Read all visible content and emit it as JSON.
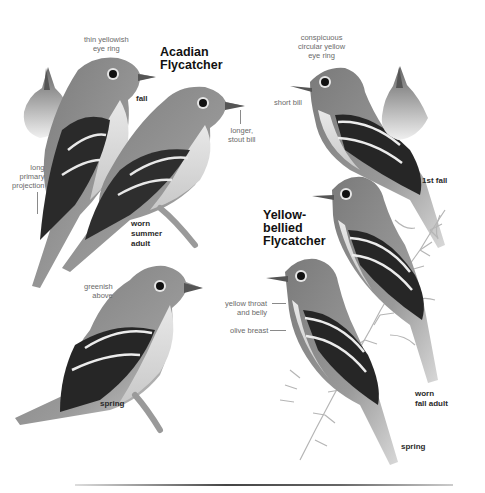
{
  "plate": {
    "type": "field-guide plate",
    "species": [
      {
        "name_lines": [
          "Acadian",
          "Flycatcher"
        ],
        "figures": [
          {
            "age_label": [
              "fall"
            ]
          },
          {
            "age_label": [
              "worn",
              "summer",
              "adult"
            ]
          },
          {
            "age_label": [
              "spring"
            ]
          }
        ],
        "annotations": [
          {
            "text": [
              "thin yellowish",
              "eye ring"
            ]
          },
          {
            "text": [
              "longer,",
              "stout bill"
            ]
          },
          {
            "text": [
              "long",
              "primary",
              "projection"
            ]
          },
          {
            "text": [
              "greenish",
              "above"
            ]
          }
        ]
      },
      {
        "name_lines": [
          "Yellow-",
          "bellied",
          "Flycatcher"
        ],
        "figures": [
          {
            "age_label": [
              "1st fall"
            ]
          },
          {
            "age_label": [
              "worn",
              "fall adult"
            ]
          },
          {
            "age_label": [
              "spring"
            ]
          }
        ],
        "annotations": [
          {
            "text": [
              "conspicuous",
              "circular yellow",
              "eye ring"
            ]
          },
          {
            "text": [
              "short bill"
            ]
          },
          {
            "text": [
              "yellow throat",
              "and belly"
            ]
          },
          {
            "text": [
              "olive breast"
            ]
          }
        ]
      }
    ]
  },
  "colors": {
    "background": "#ffffff",
    "label_gray": "#6a6a6a",
    "age_label": "#2a2a2a",
    "species_title": "#111111"
  }
}
